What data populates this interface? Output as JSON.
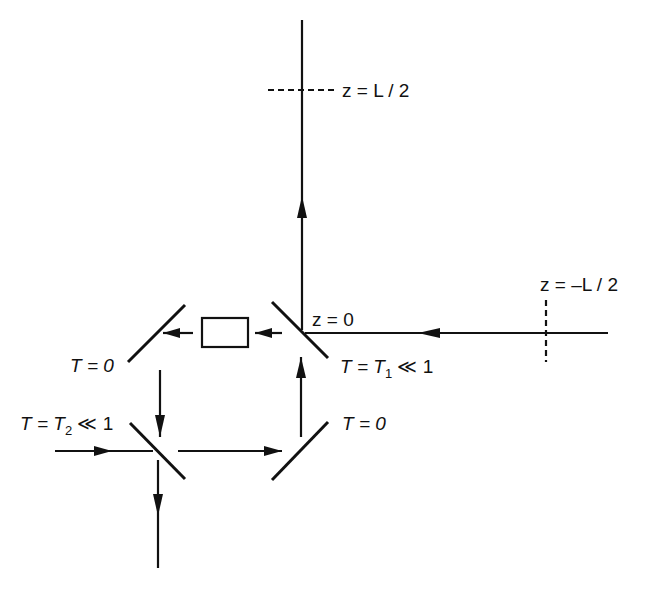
{
  "diagram": {
    "type": "ring-cavity optical setup",
    "labels": {
      "z_half": "z = L / 2",
      "z_zero": "z = 0",
      "z_neg_half": "z = –L / 2",
      "mirror_top_left": "T = 0",
      "mirror_top_right_T": "T = T",
      "mirror_top_right_sub": "1",
      "mirror_top_right_rel": " ≪ 1",
      "mirror_bottom_left_T": "T = T",
      "mirror_bottom_left_sub": "2",
      "mirror_bottom_left_rel": " ≪ 1",
      "mirror_bottom_right": "T = 0"
    },
    "components": [
      {
        "name": "input-coupler-mirror",
        "transmission": "T1 << 1"
      },
      {
        "name": "fold-mirror-top-left",
        "transmission": "0"
      },
      {
        "name": "output-coupler-mirror",
        "transmission": "T2 << 1"
      },
      {
        "name": "fold-mirror-bottom-right",
        "transmission": "0"
      },
      {
        "name": "nonlinear-crystal",
        "shape": "rectangle"
      }
    ],
    "colors": {
      "stroke": "#111111",
      "background": "#ffffff"
    }
  }
}
